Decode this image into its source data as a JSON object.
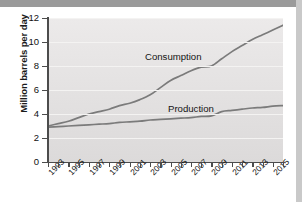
{
  "chart_data": {
    "type": "line",
    "title": "",
    "xlabel": "",
    "ylabel": "Million barrels per day",
    "ylim": [
      0,
      12
    ],
    "xlim": [
      1993,
      2016
    ],
    "yticks": [
      0,
      2,
      4,
      6,
      8,
      10,
      12
    ],
    "grid": true,
    "legend_position": "inline-annotation",
    "x": [
      1993,
      1994,
      1995,
      1996,
      1997,
      1998,
      1999,
      2000,
      2001,
      2002,
      2003,
      2004,
      2005,
      2006,
      2007,
      2008,
      2009,
      2010,
      2011,
      2012,
      2013,
      2014,
      2015,
      2016
    ],
    "xticklabels": [
      "1993",
      "",
      "1995",
      "",
      "1997",
      "",
      "1999",
      "",
      "2001",
      "",
      "2003",
      "",
      "2005",
      "",
      "2007",
      "",
      "2009",
      "",
      "2011",
      "",
      "2013",
      "",
      "2015",
      ""
    ],
    "series": [
      {
        "name": "Consumption",
        "color": "#7b7b7b",
        "values": [
          3.0,
          3.2,
          3.4,
          3.7,
          4.0,
          4.2,
          4.4,
          4.7,
          4.9,
          5.2,
          5.6,
          6.2,
          6.8,
          7.2,
          7.6,
          7.9,
          8.0,
          8.6,
          9.2,
          9.7,
          10.2,
          10.6,
          11.0,
          11.4
        ]
      },
      {
        "name": "Production",
        "color": "#7b7b7b",
        "values": [
          2.9,
          2.95,
          3.0,
          3.05,
          3.1,
          3.15,
          3.2,
          3.3,
          3.35,
          3.4,
          3.5,
          3.55,
          3.6,
          3.65,
          3.7,
          3.8,
          3.85,
          4.2,
          4.3,
          4.4,
          4.5,
          4.55,
          4.65,
          4.7
        ]
      }
    ]
  },
  "annotations": {
    "consumption_label": "Consumption",
    "production_label": "Production"
  }
}
